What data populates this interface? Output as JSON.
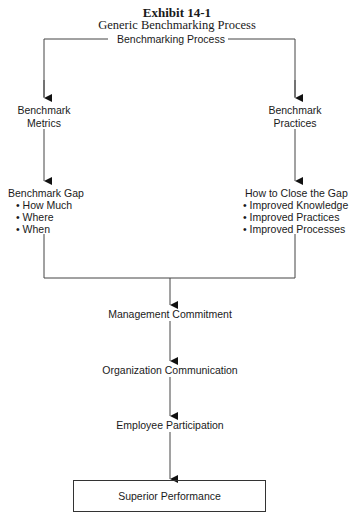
{
  "exhibit": {
    "number": "Exhibit 14-1",
    "title": "Generic Benchmarking Process"
  },
  "diagram": {
    "root": "Benchmarking Process",
    "left_branch": {
      "node1": [
        "Benchmark",
        "Metrics"
      ],
      "node2": {
        "heading": "Benchmark Gap",
        "bullets": [
          "• How Much",
          "• Where",
          "• When"
        ]
      }
    },
    "right_branch": {
      "node1": [
        "Benchmark",
        "Practices"
      ],
      "node2": {
        "heading": "How to Close the Gap",
        "bullets": [
          "• Improved Knowledge",
          "• Improved Practices",
          "• Improved Processes"
        ]
      }
    },
    "flow": [
      "Management Commitment",
      "Organization Communication",
      "Employee Participation"
    ],
    "outcome": "Superior Performance"
  }
}
